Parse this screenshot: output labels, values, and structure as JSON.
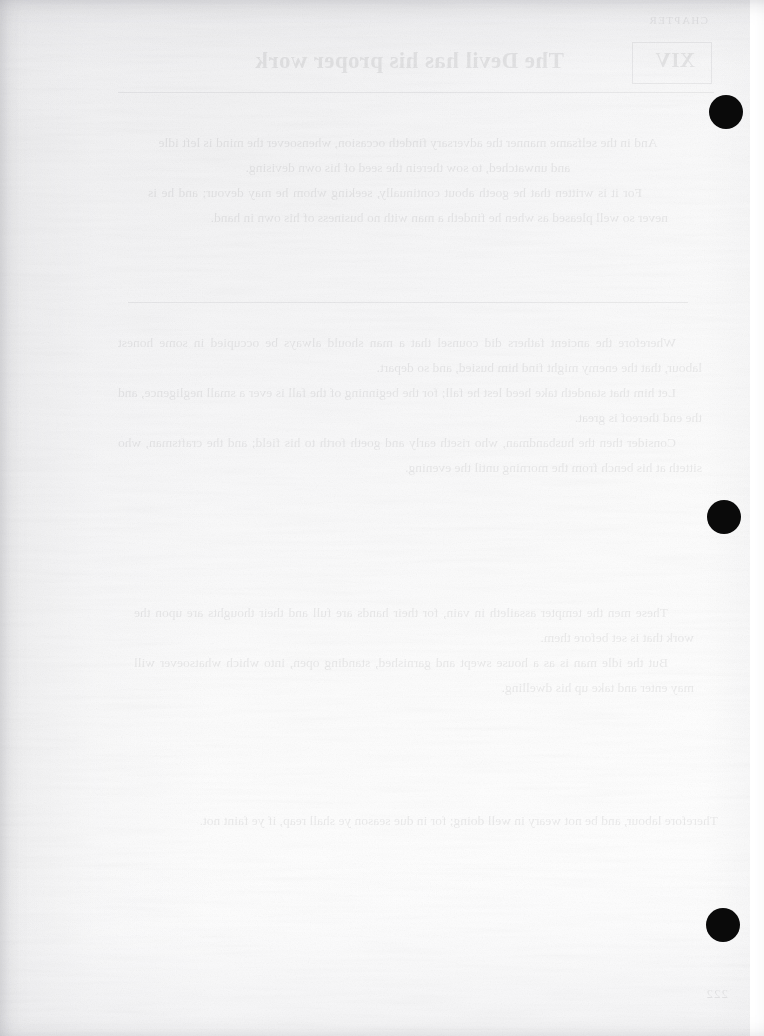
{
  "page": {
    "kind": "scanned-book-page-verso",
    "width": 764,
    "height": 1036,
    "paper_color": "#fdfdfd",
    "ink_color": "#0a0a0a"
  },
  "bleed_through": {
    "note": "All text below is reversed show-through read through the paper; it belongs to the other face of the leaf.",
    "opacity": "0.085",
    "running_head": "CHAPTER",
    "chapter_label": "XIV",
    "title": "The Devil has his proper work",
    "folio": "222",
    "paragraphs": [
      "And in the selfsame manner the adversary findeth occasion, whensoever the mind is left idle and unwatched, to sow therein the seed of his own devising.",
      "For it is written that he goeth about continually, seeking whom he may devour; and he is never so well pleased as when he findeth a man with no business of his own in hand.",
      "Wherefore the ancient fathers did counsel that a man should always be occupied in some honest labour, that the enemy might find him busied, and so depart.",
      "Let him that standeth take heed lest he fall; for the beginning of the fall is ever a small negligence, and the end thereof is great.",
      "Consider then the husbandman, who riseth early and goeth forth to his field; and the craftsman, who sitteth at his bench from the morning until the evening.",
      "These men the tempter assaileth in vain, for their hands are full and their thoughts are upon the work that is set before them.",
      "But the idle man is as a house swept and garnished, standing open, into which whatsoever will may enter and take up his dwelling.",
      "Therefore labour, and be not weary in well doing; for in due season ye shall reap, if ye faint not."
    ]
  },
  "marks": {
    "registration_dots": [
      {
        "id": "dot-top",
        "x": 726,
        "y": 112,
        "diameter": 34
      },
      {
        "id": "dot-middle",
        "x": 724,
        "y": 517,
        "diameter": 34
      },
      {
        "id": "dot-bottom",
        "x": 723,
        "y": 925,
        "diameter": 34
      }
    ],
    "guide_line": {
      "id": "right-trim-guide",
      "x": 750,
      "style": "dashed"
    }
  }
}
